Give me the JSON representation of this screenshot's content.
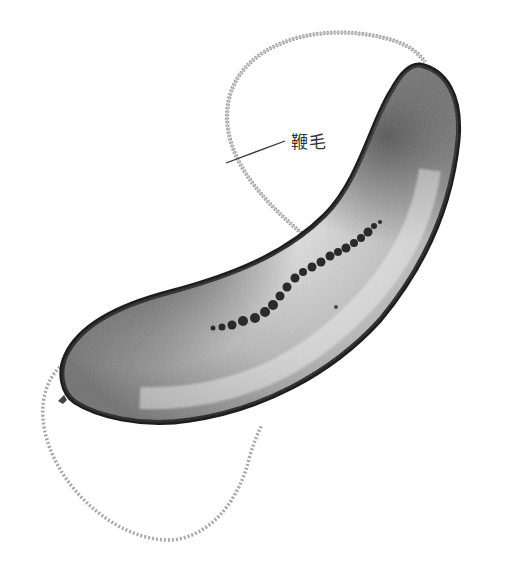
{
  "figure": {
    "labels": [
      {
        "text": "鞭毛",
        "target": "flagellum"
      }
    ],
    "colors": {
      "background": "#ffffff",
      "membrane": "#1e1e1e",
      "cytoplasm_light": "#d9d9d9",
      "cytoplasm_dark": "#7a7a7a",
      "particles": "#2a2a2a",
      "flagellum": "#8c8c8c",
      "leader_line": "#333333"
    },
    "particle_count": 22
  }
}
